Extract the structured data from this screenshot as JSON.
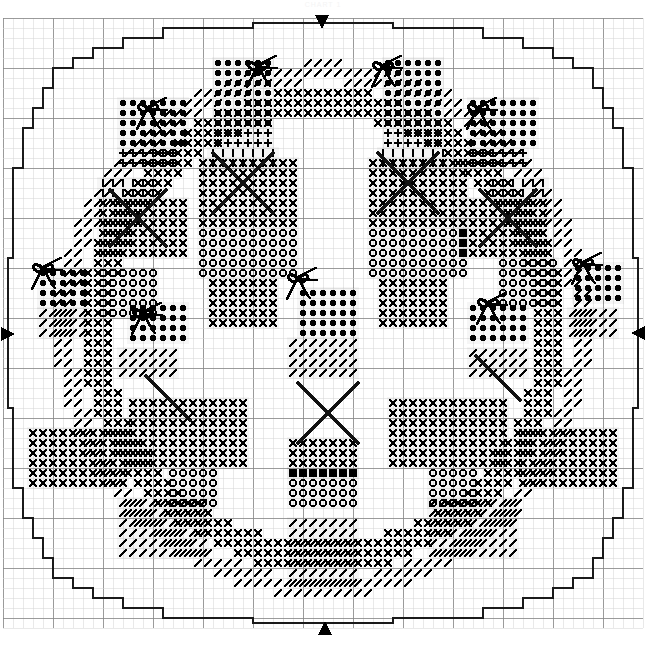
{
  "document": {
    "title": "CHART 1",
    "type": "cross-stitch-chart",
    "shape": "circular-doily",
    "width": 646,
    "height": 648
  },
  "grid": {
    "cell_px": 10,
    "major_every": 5,
    "minor_color": "#d8d8d8",
    "major_color": "#8a8a8a",
    "outline_color": "#1a1a1a",
    "origin_x": 3,
    "origin_y": 18,
    "cols": 64,
    "rows": 61
  },
  "center_markers": {
    "label": "center-arrow",
    "color": "#000000",
    "items": [
      {
        "name": "top-center-arrow",
        "dir": "down",
        "x": 322,
        "y": 22
      },
      {
        "name": "bottom-center-arrow",
        "dir": "up",
        "x": 325,
        "y": 628
      },
      {
        "name": "left-center-arrow",
        "dir": "right",
        "x": 8,
        "y": 334
      },
      {
        "name": "right-center-arrow",
        "dir": "left",
        "x": 638,
        "y": 333
      }
    ]
  },
  "symbols": {
    "legend": [
      {
        "key": "dot",
        "glyph": "●",
        "name": "filled-circle-symbol"
      },
      {
        "key": "cross",
        "glyph": "✕",
        "name": "cross-symbol"
      },
      {
        "key": "circle",
        "glyph": "○",
        "name": "open-circle-symbol"
      },
      {
        "key": "bar",
        "glyph": "I",
        "name": "vertical-bar-symbol"
      },
      {
        "key": "plus",
        "glyph": "+",
        "name": "plus-symbol"
      },
      {
        "key": "slash",
        "glyph": "/",
        "name": "forward-slash-symbol"
      },
      {
        "key": "backslash",
        "glyph": "\\",
        "name": "back-slash-symbol"
      },
      {
        "key": "dash",
        "glyph": "−",
        "name": "dash-symbol"
      },
      {
        "key": "bow",
        "glyph": "bow",
        "name": "bow-motif-symbol"
      },
      {
        "key": "bigx",
        "glyph": "X",
        "name": "large-cross-overlay-symbol"
      }
    ]
  },
  "outline_path": "M 163 28 L 253 28 L 253 23 L 393 23 L 393 28 L 483 28 L 483 38 L 523 38 L 523 48 L 553 48 L 553 58 L 573 58 L 573 68 L 593 68 L 593 88 L 603 88 L 603 108 L 613 108 L 613 128 L 623 128 L 623 168 L 633 168 L 633 258 L 638 258 L 638 408 L 633 408 L 633 488 L 623 488 L 623 518 L 613 518 L 613 538 L 603 538 L 603 558 L 593 558 L 593 578 L 573 578 L 573 588 L 553 588 L 553 598 L 523 598 L 523 608 L 483 608 L 483 618 L 393 618 L 393 623 L 253 623 L 253 618 L 163 618 L 163 608 L 123 608 L 123 598 L 93 598 L 93 588 L 73 588 L 73 578 L 53 578 L 53 558 L 43 558 L 43 538 L 33 538 L 33 518 L 23 518 L 23 488 L 13 488 L 13 408 L 8 408 L 8 258 L 13 258 L 13 168 L 23 168 L 23 128 L 33 128 L 33 108 L 43 108 L 43 88 L 53 88 L 53 68 L 73 68 L 73 58 L 93 58 L 93 48 L 123 48 L 123 38 L 163 38 Z",
  "motifs": {
    "bows": [
      {
        "name": "bow-top-left",
        "x": 148,
        "y": 108
      },
      {
        "name": "bow-top-center-left",
        "x": 258,
        "y": 66
      },
      {
        "name": "bow-top-center-right",
        "x": 383,
        "y": 66
      },
      {
        "name": "bow-top-right",
        "x": 478,
        "y": 108
      },
      {
        "name": "bow-mid-left",
        "x": 43,
        "y": 268
      },
      {
        "name": "bow-mid-left-inner",
        "x": 143,
        "y": 313
      },
      {
        "name": "bow-center",
        "x": 298,
        "y": 278
      },
      {
        "name": "bow-mid-right-inner",
        "x": 488,
        "y": 303
      },
      {
        "name": "bow-mid-right",
        "x": 583,
        "y": 263
      }
    ],
    "big_crosses": [
      {
        "name": "big-cross-left",
        "x": 138,
        "y": 218,
        "r": 28
      },
      {
        "name": "big-cross-upper-left",
        "x": 243,
        "y": 183,
        "r": 30
      },
      {
        "name": "big-cross-upper-right",
        "x": 408,
        "y": 183,
        "r": 30
      },
      {
        "name": "big-cross-right",
        "x": 508,
        "y": 218,
        "r": 28
      },
      {
        "name": "big-cross-bottom",
        "x": 328,
        "y": 413,
        "r": 30
      },
      {
        "name": "big-stroke-lower-left",
        "x": 168,
        "y": 398,
        "r": 22
      },
      {
        "name": "big-stroke-lower-right",
        "x": 498,
        "y": 378,
        "r": 22
      }
    ]
  },
  "blocks": [
    {
      "name": "block-top-left-dots",
      "sym": "dot",
      "x": 118,
      "y": 98,
      "cols": 7,
      "rows": 5
    },
    {
      "name": "block-top-mid-l-dots",
      "sym": "dot",
      "x": 213,
      "y": 58,
      "cols": 6,
      "rows": 7
    },
    {
      "name": "block-top-mid-r-dots",
      "sym": "dot",
      "x": 383,
      "y": 58,
      "cols": 6,
      "rows": 7
    },
    {
      "name": "block-top-right-dots",
      "sym": "dot",
      "x": 468,
      "y": 98,
      "cols": 7,
      "rows": 5
    },
    {
      "name": "block-top-left-plus",
      "sym": "plus",
      "x": 118,
      "y": 148,
      "cols": 6,
      "rows": 2
    },
    {
      "name": "block-top-mid-l-plus",
      "sym": "plus",
      "x": 213,
      "y": 128,
      "cols": 6,
      "rows": 2
    },
    {
      "name": "block-top-mid-r-plus",
      "sym": "plus",
      "x": 383,
      "y": 128,
      "cols": 6,
      "rows": 2
    },
    {
      "name": "block-top-right-plus",
      "sym": "plus",
      "x": 468,
      "y": 148,
      "cols": 6,
      "rows": 2
    },
    {
      "name": "block-bars-upper-left",
      "sym": "bar",
      "x": 98,
      "y": 178,
      "cols": 6,
      "rows": 2
    },
    {
      "name": "block-bars-upper-ctr1",
      "sym": "bar",
      "x": 208,
      "y": 148,
      "cols": 7,
      "rows": 2
    },
    {
      "name": "block-bars-upper-ctr2",
      "sym": "bar",
      "x": 378,
      "y": 148,
      "cols": 7,
      "rows": 2
    },
    {
      "name": "block-bars-upper-right",
      "sym": "bar",
      "x": 488,
      "y": 178,
      "cols": 6,
      "rows": 2
    },
    {
      "name": "block-x-left-1",
      "sym": "cross",
      "x": 98,
      "y": 198,
      "cols": 9,
      "rows": 6
    },
    {
      "name": "block-x-ctr-left",
      "sym": "cross",
      "x": 198,
      "y": 158,
      "cols": 10,
      "rows": 7
    },
    {
      "name": "block-x-ctr-right",
      "sym": "cross",
      "x": 368,
      "y": 158,
      "cols": 10,
      "rows": 7
    },
    {
      "name": "block-x-right-1",
      "sym": "cross",
      "x": 458,
      "y": 198,
      "cols": 9,
      "rows": 6
    },
    {
      "name": "block-circles-ctr-l",
      "sym": "circle",
      "x": 198,
      "y": 228,
      "cols": 10,
      "rows": 5
    },
    {
      "name": "block-circles-ctr-r",
      "sym": "circle",
      "x": 368,
      "y": 228,
      "cols": 10,
      "rows": 5
    },
    {
      "name": "block-circles-left",
      "sym": "circle",
      "x": 98,
      "y": 268,
      "cols": 6,
      "rows": 5
    },
    {
      "name": "block-circles-right",
      "sym": "circle",
      "x": 498,
      "y": 258,
      "cols": 6,
      "rows": 5
    },
    {
      "name": "block-x-ctr-l-low",
      "sym": "cross",
      "x": 208,
      "y": 278,
      "cols": 7,
      "rows": 5
    },
    {
      "name": "block-x-ctr-r-low",
      "sym": "cross",
      "x": 378,
      "y": 278,
      "cols": 7,
      "rows": 5
    },
    {
      "name": "block-dots-left",
      "sym": "dot",
      "x": 38,
      "y": 268,
      "cols": 5,
      "rows": 4
    },
    {
      "name": "block-dots-mid-left",
      "sym": "dot",
      "x": 128,
      "y": 303,
      "cols": 6,
      "rows": 4
    },
    {
      "name": "block-dots-center",
      "sym": "dot",
      "x": 298,
      "y": 288,
      "cols": 6,
      "rows": 5
    },
    {
      "name": "block-dots-mid-right",
      "sym": "dot",
      "x": 468,
      "y": 303,
      "cols": 6,
      "rows": 4
    },
    {
      "name": "block-dots-right",
      "sym": "dot",
      "x": 573,
      "y": 263,
      "cols": 5,
      "rows": 4
    },
    {
      "name": "block-diag-left",
      "sym": "slash",
      "x": 38,
      "y": 308,
      "cols": 5,
      "rows": 3
    },
    {
      "name": "block-diag-mid-left",
      "sym": "slash",
      "x": 118,
      "y": 348,
      "cols": 6,
      "rows": 3
    },
    {
      "name": "block-diag-center",
      "sym": "slash",
      "x": 288,
      "y": 338,
      "cols": 7,
      "rows": 4
    },
    {
      "name": "block-diag-mid-right",
      "sym": "slash",
      "x": 468,
      "y": 348,
      "cols": 6,
      "rows": 3
    },
    {
      "name": "block-diag-right",
      "sym": "slash",
      "x": 568,
      "y": 308,
      "cols": 5,
      "rows": 3
    },
    {
      "name": "block-x-lower-left",
      "sym": "cross",
      "x": 28,
      "y": 428,
      "cols": 10,
      "rows": 6
    },
    {
      "name": "block-x-lower-ctr-l",
      "sym": "cross",
      "x": 128,
      "y": 398,
      "cols": 12,
      "rows": 7
    },
    {
      "name": "block-x-lower-ctr-r",
      "sym": "cross",
      "x": 388,
      "y": 398,
      "cols": 12,
      "rows": 7
    },
    {
      "name": "block-x-lower-right",
      "sym": "cross",
      "x": 518,
      "y": 428,
      "cols": 10,
      "rows": 6
    },
    {
      "name": "block-circles-low-l",
      "sym": "circle",
      "x": 168,
      "y": 468,
      "cols": 5,
      "rows": 4
    },
    {
      "name": "block-circles-low-ctr",
      "sym": "circle",
      "x": 288,
      "y": 468,
      "cols": 7,
      "rows": 4
    },
    {
      "name": "block-circles-low-r",
      "sym": "circle",
      "x": 428,
      "y": 468,
      "cols": 5,
      "rows": 4
    },
    {
      "name": "block-x-bottom-ctr",
      "sym": "cross",
      "x": 288,
      "y": 438,
      "cols": 7,
      "rows": 4
    },
    {
      "name": "block-diag-bottom-l",
      "sym": "slash",
      "x": 118,
      "y": 498,
      "cols": 9,
      "rows": 6
    },
    {
      "name": "block-diag-bottom-c",
      "sym": "slash",
      "x": 288,
      "y": 518,
      "cols": 7,
      "rows": 7
    },
    {
      "name": "block-diag-bottom-r",
      "sym": "slash",
      "x": 428,
      "y": 498,
      "cols": 9,
      "rows": 6
    }
  ],
  "ui": {
    "alt_text": "Circular cross-stitch needlework chart with stepped round border, four center-position arrows, and repeating floral bow motifs worked in dots, crosses, circles, bars, pluses and diagonal stitches."
  }
}
